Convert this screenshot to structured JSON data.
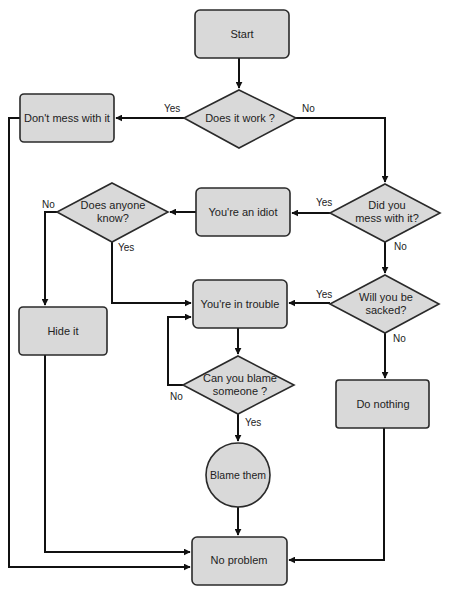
{
  "diagram": {
    "type": "flowchart",
    "colors": {
      "node_fill": "#d9d9d9",
      "node_stroke": "#2a2a2a",
      "edge": "#111111",
      "text": "#222222",
      "background": "#ffffff"
    },
    "nodes": {
      "start": {
        "label": "Start",
        "shape": "rounded-rect"
      },
      "does_it_work": {
        "label": "Does it work ?",
        "shape": "diamond"
      },
      "dont_mess": {
        "label": "Don't mess with it",
        "shape": "rounded-rect"
      },
      "did_you_mess": {
        "label_line1": "Did you",
        "label_line2": "mess with it?",
        "shape": "diamond"
      },
      "youre_an_idiot": {
        "label": "You're an idiot",
        "shape": "rounded-rect"
      },
      "does_anyone_know": {
        "label_line1": "Does anyone",
        "label_line2": "know?",
        "shape": "diamond"
      },
      "hide_it": {
        "label": "Hide it",
        "shape": "rounded-rect"
      },
      "youre_in_trouble": {
        "label": "You're in trouble",
        "shape": "rounded-rect"
      },
      "will_you_be_sacked": {
        "label_line1": "Will you be",
        "label_line2": "sacked?",
        "shape": "diamond"
      },
      "can_you_blame": {
        "label_line1": "Can you blame",
        "label_line2": "someone ?",
        "shape": "diamond"
      },
      "do_nothing": {
        "label": "Do nothing",
        "shape": "rounded-rect"
      },
      "blame_them": {
        "label": "Blame them",
        "shape": "circle"
      },
      "no_problem": {
        "label": "No problem",
        "shape": "rounded-rect"
      }
    },
    "edge_labels": {
      "work_yes": "Yes",
      "work_no": "No",
      "mess_yes": "Yes",
      "mess_no": "No",
      "know_no": "No",
      "know_yes": "Yes",
      "sacked_yes": "Yes",
      "sacked_no": "No",
      "blame_no": "No",
      "blame_yes": "Yes"
    },
    "edges": [
      {
        "from": "start",
        "to": "does_it_work",
        "label": ""
      },
      {
        "from": "does_it_work",
        "to": "dont_mess",
        "label": "Yes"
      },
      {
        "from": "does_it_work",
        "to": "did_you_mess",
        "label": "No"
      },
      {
        "from": "dont_mess",
        "to": "no_problem",
        "label": ""
      },
      {
        "from": "did_you_mess",
        "to": "youre_an_idiot",
        "label": "Yes"
      },
      {
        "from": "did_you_mess",
        "to": "will_you_be_sacked",
        "label": "No"
      },
      {
        "from": "youre_an_idiot",
        "to": "does_anyone_know",
        "label": ""
      },
      {
        "from": "does_anyone_know",
        "to": "hide_it",
        "label": "No"
      },
      {
        "from": "does_anyone_know",
        "to": "youre_in_trouble",
        "label": "Yes"
      },
      {
        "from": "hide_it",
        "to": "no_problem",
        "label": ""
      },
      {
        "from": "will_you_be_sacked",
        "to": "youre_in_trouble",
        "label": "Yes"
      },
      {
        "from": "will_you_be_sacked",
        "to": "do_nothing",
        "label": "No"
      },
      {
        "from": "youre_in_trouble",
        "to": "can_you_blame",
        "label": ""
      },
      {
        "from": "can_you_blame",
        "to": "youre_in_trouble",
        "label": "No"
      },
      {
        "from": "can_you_blame",
        "to": "blame_them",
        "label": "Yes"
      },
      {
        "from": "blame_them",
        "to": "no_problem",
        "label": ""
      },
      {
        "from": "do_nothing",
        "to": "no_problem",
        "label": ""
      }
    ]
  }
}
